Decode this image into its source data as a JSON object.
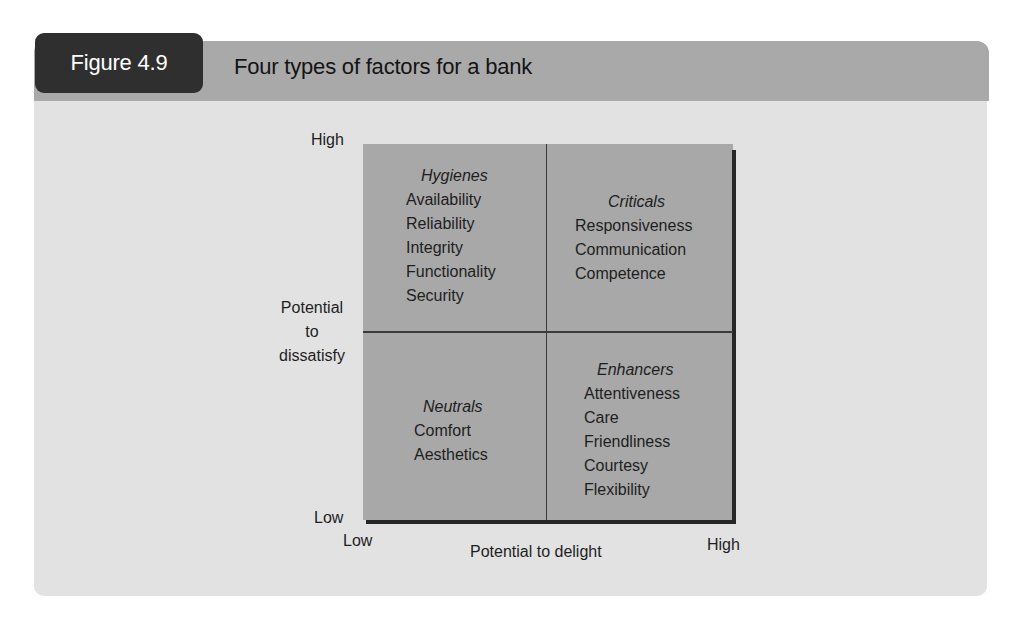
{
  "figure": {
    "number_label": "Figure 4.9",
    "title": "Four types of factors for a bank"
  },
  "chart_data": {
    "type": "quadrant-matrix",
    "title": "Four types of factors for a bank",
    "xlabel": "Potential to delight",
    "ylabel": "Potential to dissatisfy",
    "x_ticks": [
      "Low",
      "High"
    ],
    "y_ticks": [
      "Low",
      "High"
    ],
    "quadrants": [
      {
        "position": "top-left",
        "x": "Low",
        "y": "High",
        "name": "Hygienes",
        "items": [
          "Availability",
          "Reliability",
          "Integrity",
          "Functionality",
          "Security"
        ]
      },
      {
        "position": "top-right",
        "x": "High",
        "y": "High",
        "name": "Criticals",
        "items": [
          "Responsiveness",
          "Communication",
          "Competence"
        ]
      },
      {
        "position": "bottom-left",
        "x": "Low",
        "y": "Low",
        "name": "Neutrals",
        "items": [
          "Comfort",
          "Aesthetics"
        ]
      },
      {
        "position": "bottom-right",
        "x": "High",
        "y": "Low",
        "name": "Enhancers",
        "items": [
          "Attentiveness",
          "Care",
          "Friendliness",
          "Courtesy",
          "Flexibility"
        ]
      }
    ]
  },
  "axes": {
    "y": {
      "high": "High",
      "low": "Low",
      "title_lines": [
        "Potential",
        "to",
        "dissatisfy"
      ]
    },
    "x": {
      "low": "Low",
      "high": "High",
      "title": "Potential to delight"
    }
  },
  "quadrants": {
    "hygienes": {
      "heading": "Hygienes",
      "items": [
        "Availability",
        "Reliability",
        "Integrity",
        "Functionality",
        "Security"
      ]
    },
    "criticals": {
      "heading": "Criticals",
      "items": [
        "Responsiveness",
        "Communication",
        "Competence"
      ]
    },
    "neutrals": {
      "heading": "Neutrals",
      "items": [
        "Comfort",
        "Aesthetics"
      ]
    },
    "enhancers": {
      "heading": "Enhancers",
      "items": [
        "Attentiveness",
        "Care",
        "Friendliness",
        "Courtesy",
        "Flexibility"
      ]
    }
  },
  "colors": {
    "panel_bg": "#e2e2e2",
    "header_bar": "#a9a9a9",
    "badge_bg": "#2f2f2f",
    "quadrant_fill": "#a8a8a8",
    "axis_shadow": "#262626"
  }
}
